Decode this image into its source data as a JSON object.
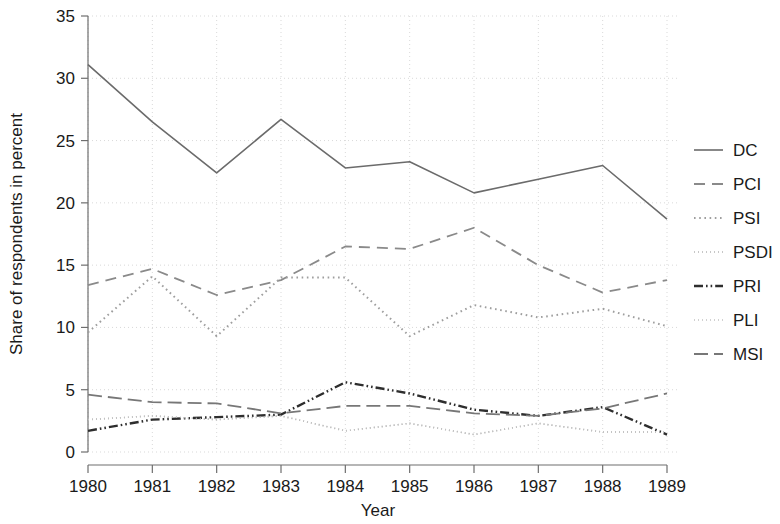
{
  "chart_data": {
    "type": "line",
    "title": "",
    "xlabel": "Year",
    "ylabel": "Share of respondents in percent",
    "categories": [
      "1980",
      "1981",
      "1982",
      "1983",
      "1984",
      "1985",
      "1986",
      "1987",
      "1988",
      "1989"
    ],
    "x": [
      1980,
      1981,
      1982,
      1983,
      1984,
      1985,
      1986,
      1987,
      1988,
      1989
    ],
    "xlim": [
      1980,
      1989
    ],
    "ylim": [
      0,
      35
    ],
    "yticks": [
      0,
      5,
      10,
      15,
      20,
      25,
      30,
      35
    ],
    "grid": true,
    "legend_position": "right",
    "series": [
      {
        "name": "DC",
        "style": "solid",
        "color": "#6b6b6b",
        "values": [
          31.1,
          26.5,
          22.4,
          26.7,
          22.8,
          23.3,
          20.8,
          21.9,
          23.0,
          18.7
        ]
      },
      {
        "name": "PCI",
        "style": "dashed",
        "color": "#8a8a8a",
        "values": [
          13.4,
          14.7,
          12.6,
          13.8,
          16.5,
          16.3,
          18.0,
          15.0,
          12.8,
          13.8
        ]
      },
      {
        "name": "PSI",
        "style": "dotted",
        "color": "#9e9e9e",
        "values": [
          9.6,
          14.1,
          9.3,
          14.0,
          14.0,
          9.3,
          11.8,
          10.8,
          11.5,
          10.1
        ]
      },
      {
        "name": "PSDI",
        "style": "fine-dotted",
        "color": "#b5b5b5",
        "values": [
          2.6,
          2.9,
          2.6,
          2.9,
          1.7,
          2.3,
          1.4,
          2.3,
          1.6,
          1.6
        ]
      },
      {
        "name": "PRI",
        "style": "dash-dot",
        "color": "#2e2e2e",
        "values": [
          1.7,
          2.6,
          2.8,
          3.0,
          5.6,
          4.7,
          3.4,
          2.9,
          3.6,
          1.4
        ]
      },
      {
        "name": "PLI",
        "style": "fine-dotted",
        "color": "#c2c2c2",
        "values": [
          2.6,
          2.9,
          2.6,
          2.9,
          1.7,
          2.3,
          1.4,
          2.3,
          1.6,
          1.6
        ]
      },
      {
        "name": "MSI",
        "style": "long-dash",
        "color": "#777777",
        "values": [
          4.6,
          4.0,
          3.9,
          3.1,
          3.7,
          3.7,
          3.1,
          2.9,
          3.5,
          4.7
        ]
      }
    ]
  },
  "axes": {
    "y_title": "Share of respondents in percent",
    "x_title": "Year",
    "y_tick_labels": [
      "35",
      "30",
      "25",
      "20",
      "15",
      "10",
      "5",
      "0"
    ],
    "x_tick_labels": [
      "1980",
      "1981",
      "1982",
      "1983",
      "1984",
      "1985",
      "1986",
      "1987",
      "1988",
      "1989"
    ]
  },
  "legend": {
    "entries": [
      {
        "label": "DC"
      },
      {
        "label": "PCI"
      },
      {
        "label": "PSI"
      },
      {
        "label": "PSDI"
      },
      {
        "label": "PRI"
      },
      {
        "label": "PLI"
      },
      {
        "label": "MSI"
      }
    ]
  }
}
